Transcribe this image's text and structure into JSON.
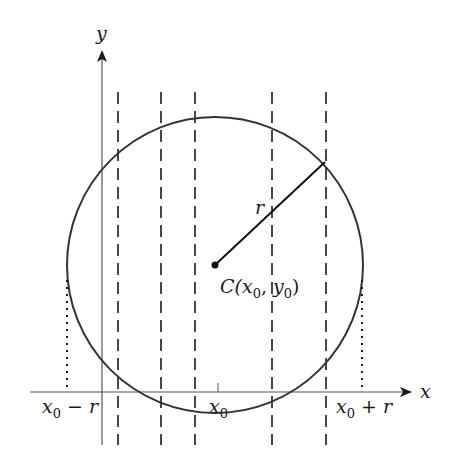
{
  "figure": {
    "axes": {
      "x_label": "x",
      "y_label": "y"
    },
    "circle": {
      "center_label_prefix": "C(",
      "center_x_var": "x",
      "center_x_sub": "0",
      "center_sep": ", ",
      "center_y_var": "y",
      "center_y_sub": "0",
      "center_label_suffix": ")",
      "radius_label": "r"
    },
    "x_ticks": [
      {
        "var": "x",
        "sub": "0",
        "suffix": " − r"
      },
      {
        "var": "x",
        "sub": "0",
        "suffix": ""
      },
      {
        "var": "x",
        "sub": "0",
        "suffix": " + r"
      }
    ],
    "dashed_lines_count": 5,
    "colors": {
      "stroke": "#2a2a2a",
      "axis": "#555555",
      "background": "#ffffff"
    }
  }
}
